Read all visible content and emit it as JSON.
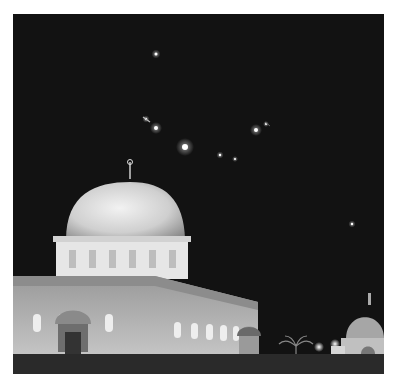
{
  "image": {
    "description": "Grayscale night photograph of a large illuminated domed building with several bright points of light streaking across the dark sky above; a smaller domed structure and a palm tree at lower right.",
    "colors": {
      "sky": "#121212",
      "dome": "#d8d8d8",
      "building": "#b0b0b0",
      "ground": "#2a2a2a",
      "frame": "#ffffff"
    },
    "lights": [
      {
        "x": 143,
        "y": 40,
        "r": 1.5
      },
      {
        "x": 133,
        "y": 105,
        "r": 1.2
      },
      {
        "x": 143,
        "y": 114,
        "r": 2
      },
      {
        "x": 172,
        "y": 133,
        "r": 3
      },
      {
        "x": 243,
        "y": 116,
        "r": 2
      },
      {
        "x": 207,
        "y": 141,
        "r": 1.2
      },
      {
        "x": 222,
        "y": 145,
        "r": 1
      },
      {
        "x": 253,
        "y": 110,
        "r": 1
      },
      {
        "x": 339,
        "y": 210,
        "r": 1.2
      }
    ]
  }
}
